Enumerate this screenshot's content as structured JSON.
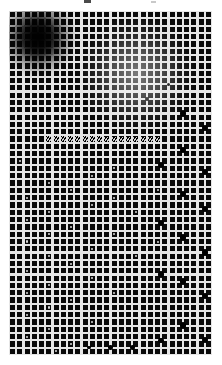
{
  "figure": {
    "title": "",
    "background_color": "#ffffff",
    "canvas": {
      "width": 222,
      "height": 365
    },
    "margins": {
      "left": 9,
      "top": 11,
      "right": 10,
      "bottom": 10
    }
  },
  "topmark": {
    "label": "",
    "x": 84,
    "y": 0,
    "width": 7,
    "height": 3,
    "color": "#4a4a4a"
  },
  "topmark2": {
    "label": "",
    "x": 151,
    "y": 1,
    "width": 5,
    "height": 2,
    "color": "#c9c9c9"
  },
  "chart_data": {
    "type": "heatmap",
    "title": "",
    "subtitle": "",
    "xlabel": "",
    "ylabel": "",
    "grid": true,
    "legend_position": "none",
    "columns": 28,
    "rows": 47,
    "cell_pitch": 7.38,
    "gridline_width": 2.1,
    "colors": {
      "square": "#090909",
      "gridline_bright": "#e6e6e6",
      "gridline_dim": "#5a5a5a",
      "background": "#0a0a0a",
      "white_dot": "#d8d8d8",
      "node": "#000000",
      "stripe_dark": "#000000",
      "stripe_light": "#cfcfcf"
    },
    "blob": {
      "name": "dark-gaussian-blob",
      "center_col": 4.0,
      "center_row": 3.6,
      "radius_cells": 3.6,
      "peak_opacity": 0.97
    },
    "glow": {
      "name": "bright-shrink-region",
      "center_col": 17.6,
      "center_row": 8.6,
      "radius_cells": 6.2,
      "peak_opacity": 0.82,
      "min_square_scale": 0.26
    },
    "stripe_band": {
      "name": "diagonal-stripe-band",
      "row": 17,
      "col_start": 5,
      "col_end": 20,
      "angle_deg": -55,
      "period_px": 2.2
    },
    "white_dots": [
      {
        "col": 2,
        "row": 25,
        "r": 1.1
      },
      {
        "col": 2,
        "row": 28,
        "r": 1.0
      },
      {
        "col": 2,
        "row": 31,
        "r": 1.1
      },
      {
        "col": 2,
        "row": 35,
        "r": 1.0
      },
      {
        "col": 2,
        "row": 38,
        "r": 1.1
      },
      {
        "col": 2,
        "row": 41,
        "r": 1.0
      },
      {
        "col": 2,
        "row": 44,
        "r": 1.0
      },
      {
        "col": 5,
        "row": 23,
        "r": 1.0
      },
      {
        "col": 5,
        "row": 27,
        "r": 1.1
      },
      {
        "col": 5,
        "row": 30,
        "r": 1.0
      },
      {
        "col": 5,
        "row": 33,
        "r": 1.1
      },
      {
        "col": 5,
        "row": 37,
        "r": 1.0
      },
      {
        "col": 5,
        "row": 40,
        "r": 1.1
      },
      {
        "col": 5,
        "row": 43,
        "r": 1.0
      },
      {
        "col": 8,
        "row": 24,
        "r": 1.0
      },
      {
        "col": 8,
        "row": 29,
        "r": 1.1
      },
      {
        "col": 8,
        "row": 34,
        "r": 1.0
      },
      {
        "col": 8,
        "row": 39,
        "r": 1.0
      },
      {
        "col": 8,
        "row": 45,
        "r": 1.0
      },
      {
        "col": 11,
        "row": 22,
        "r": 1.1
      },
      {
        "col": 11,
        "row": 26,
        "r": 1.0
      },
      {
        "col": 11,
        "row": 32,
        "r": 1.1
      },
      {
        "col": 11,
        "row": 36,
        "r": 1.0
      },
      {
        "col": 11,
        "row": 42,
        "r": 1.0
      },
      {
        "col": 14,
        "row": 21,
        "r": 1.0
      },
      {
        "col": 14,
        "row": 25,
        "r": 1.0
      },
      {
        "col": 14,
        "row": 30,
        "r": 1.0
      },
      {
        "col": 14,
        "row": 38,
        "r": 1.0
      },
      {
        "col": 17,
        "row": 27,
        "r": 1.0
      },
      {
        "col": 17,
        "row": 33,
        "r": 1.0
      },
      {
        "col": 20,
        "row": 24,
        "r": 1.0
      },
      {
        "col": 20,
        "row": 31,
        "r": 1.0
      },
      {
        "col": 1,
        "row": 20,
        "r": 0.9
      },
      {
        "col": 3,
        "row": 47,
        "r": 0.9
      },
      {
        "col": 9,
        "row": 47,
        "r": 0.9
      },
      {
        "col": 6,
        "row": 46,
        "r": 0.9
      }
    ],
    "nodes": [
      {
        "col": 24,
        "row": 14,
        "r": 3.3
      },
      {
        "col": 27,
        "row": 16,
        "r": 3.1
      },
      {
        "col": 24,
        "row": 19,
        "r": 3.4
      },
      {
        "col": 21,
        "row": 21,
        "r": 3.0
      },
      {
        "col": 27,
        "row": 22,
        "r": 3.2
      },
      {
        "col": 24,
        "row": 25,
        "r": 3.4
      },
      {
        "col": 27,
        "row": 27,
        "r": 3.1
      },
      {
        "col": 21,
        "row": 29,
        "r": 3.0
      },
      {
        "col": 24,
        "row": 31,
        "r": 3.4
      },
      {
        "col": 27,
        "row": 33,
        "r": 3.2
      },
      {
        "col": 21,
        "row": 36,
        "r": 3.1
      },
      {
        "col": 24,
        "row": 37,
        "r": 3.4
      },
      {
        "col": 27,
        "row": 39,
        "r": 3.0
      },
      {
        "col": 24,
        "row": 43,
        "r": 3.3
      },
      {
        "col": 27,
        "row": 45,
        "r": 3.1
      },
      {
        "col": 21,
        "row": 45,
        "r": 2.8
      },
      {
        "col": 17,
        "row": 46,
        "r": 2.6
      },
      {
        "col": 14,
        "row": 46,
        "r": 2.2
      },
      {
        "col": 11,
        "row": 46,
        "r": 1.8
      },
      {
        "col": 19,
        "row": 12,
        "r": 2.0
      },
      {
        "col": 22,
        "row": 10,
        "r": 1.6
      }
    ]
  }
}
